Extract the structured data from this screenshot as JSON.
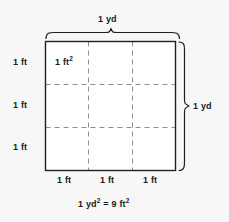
{
  "figure": {
    "colors": {
      "background": "#f7f7f7",
      "square_fill": "#ffffff",
      "outline": "#231f20",
      "dashed": "#8d8d8d",
      "brace": "#231f20",
      "text": "#1a1a1a"
    },
    "square": {
      "label_cell_area_value": "1 ft",
      "label_cell_area_sup": "2",
      "rows": 3,
      "columns": 3,
      "geometry": {
        "x": 45,
        "y": 41,
        "width": 131,
        "height": 130
      }
    },
    "top_brace": {
      "label": "1 yd",
      "from_x": 45,
      "to_x": 180,
      "y": 35
    },
    "right_brace": {
      "label": "1 yd",
      "from_y": 41,
      "to_y": 171,
      "x": 182
    },
    "left_labels": [
      "1 ft",
      "1 ft",
      "1 ft"
    ],
    "bottom_labels": [
      "1 ft",
      "1 ft",
      "1 ft"
    ],
    "equation": {
      "left_value": "1 yd",
      "left_sup": "2",
      "operator": "=",
      "right_value": "9 ft",
      "right_sup": "2",
      "full_text": "1 yd2 = 9 ft2"
    }
  }
}
